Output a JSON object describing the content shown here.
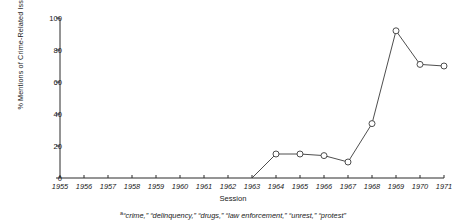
{
  "chart_data": {
    "type": "line",
    "title": "",
    "xlabel": "Session",
    "ylabel": "% Mentions of Crime-Related Issues",
    "ylabel_superscript": "a",
    "footnote_marker": "a",
    "footnote": "“crime,” “delinquency,” “drugs,” “law enforcement,” “unrest,” “protest”",
    "categories": [
      "1955",
      "1956",
      "1957",
      "1958",
      "1959",
      "1960",
      "1961",
      "1962",
      "1963",
      "1964",
      "1965",
      "1966",
      "1967",
      "1968",
      "1969",
      "1970",
      "1971"
    ],
    "x": [
      1955,
      1956,
      1957,
      1958,
      1959,
      1960,
      1961,
      1962,
      1963,
      1964,
      1965,
      1966,
      1967,
      1968,
      1969,
      1970,
      1971
    ],
    "values": [
      null,
      null,
      null,
      null,
      null,
      null,
      null,
      null,
      0,
      15,
      15,
      14,
      10,
      34,
      92,
      71,
      70
    ],
    "xlim": [
      1955,
      1971
    ],
    "ylim": [
      0,
      100
    ],
    "yticks": [
      0,
      20,
      40,
      60,
      80,
      100
    ],
    "ytick_labels": [
      "0",
      "20",
      "40",
      "60",
      "80",
      "100"
    ],
    "xticks": [
      1955,
      1956,
      1957,
      1958,
      1959,
      1960,
      1961,
      1962,
      1963,
      1964,
      1965,
      1966,
      1967,
      1968,
      1969,
      1970,
      1971
    ],
    "grid": false,
    "legend": null,
    "marker": "open-circle",
    "line_color": "#3a3a3a",
    "marker_fill": "#ffffff",
    "axis_color": "#2b2b2b"
  }
}
